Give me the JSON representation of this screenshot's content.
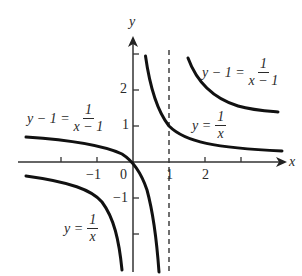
{
  "diagram": {
    "type": "function-graph",
    "axes": {
      "x_label": "x",
      "y_label": "y",
      "origin_label": "0",
      "x_tick_labels": [
        {
          "value": -1,
          "text": "−1"
        },
        {
          "value": 1,
          "text": "1"
        },
        {
          "value": 2,
          "text": "2"
        }
      ],
      "y_tick_labels": [
        {
          "value": 2,
          "text": "2"
        },
        {
          "value": 1,
          "text": "1"
        },
        {
          "value": -1,
          "text": "−1"
        }
      ],
      "x_ticks": [
        -2,
        -1,
        1,
        2,
        3
      ],
      "y_ticks": [
        2,
        1,
        -1,
        -2
      ]
    },
    "asymptote": {
      "type": "vertical-dashed",
      "x": 1
    },
    "curves": [
      {
        "name": "y = 1/x (right branch)",
        "lhs": "y",
        "num": "1",
        "den": "x"
      },
      {
        "name": "y = 1/x (left branch)",
        "lhs": "y",
        "num": "1",
        "den": "x"
      },
      {
        "name": "y - 1 = 1/(x-1) (right branch)",
        "lhs": "y − 1",
        "num": "1",
        "den": "x − 1"
      },
      {
        "name": "y - 1 = 1/(x-1) (left branch)",
        "lhs": "y − 1",
        "num": "1",
        "den": "x − 1"
      }
    ],
    "labels": {
      "shifted_upper_right": {
        "lhs": "y − 1 =",
        "num": "1",
        "den": "x − 1"
      },
      "shifted_left": {
        "lhs": "y − 1 =",
        "num": "1",
        "den": "x − 1"
      },
      "base_right": {
        "lhs": "y =",
        "num": "1",
        "den": "x"
      },
      "base_left": {
        "lhs": "y =",
        "num": "1",
        "den": "x"
      }
    },
    "colors": {
      "ink": "#111111",
      "text": "#2a2a2a",
      "background": "#ffffff"
    }
  }
}
